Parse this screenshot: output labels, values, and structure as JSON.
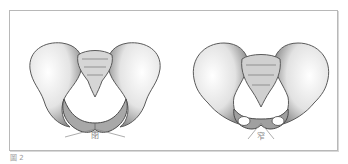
{
  "figure": {
    "caption": "圖 2",
    "panels": [
      {
        "name": "female-pelvis",
        "label": "閉"
      },
      {
        "name": "male-pelvis",
        "label": "窄"
      }
    ]
  }
}
